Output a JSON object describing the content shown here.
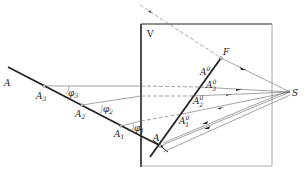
{
  "diagram": {
    "plane_label": "V",
    "source_label": "S",
    "focus_label": "F",
    "object_line": {
      "points": [
        {
          "label": "A",
          "sub": ""
        },
        {
          "label": "A",
          "sub": "3"
        },
        {
          "label": "A",
          "sub": "2"
        },
        {
          "label": "A",
          "sub": "1"
        },
        {
          "label": "A",
          "sub": ""
        }
      ]
    },
    "angles": [
      {
        "label": "φ",
        "sub": "3"
      },
      {
        "label": "φ",
        "sub": "2"
      },
      {
        "label": "φ",
        "sub": "1"
      }
    ],
    "image_points": [
      {
        "label": "A",
        "sup": "0",
        "sub": ""
      },
      {
        "label": "A",
        "sup": "0",
        "sub": "3"
      },
      {
        "label": "A",
        "sup": "0",
        "sub": "2"
      },
      {
        "label": "A",
        "sup": "0",
        "sub": "1"
      }
    ],
    "colors": {
      "line": "#222222",
      "thin": "#555555",
      "dash": "#777777"
    }
  }
}
